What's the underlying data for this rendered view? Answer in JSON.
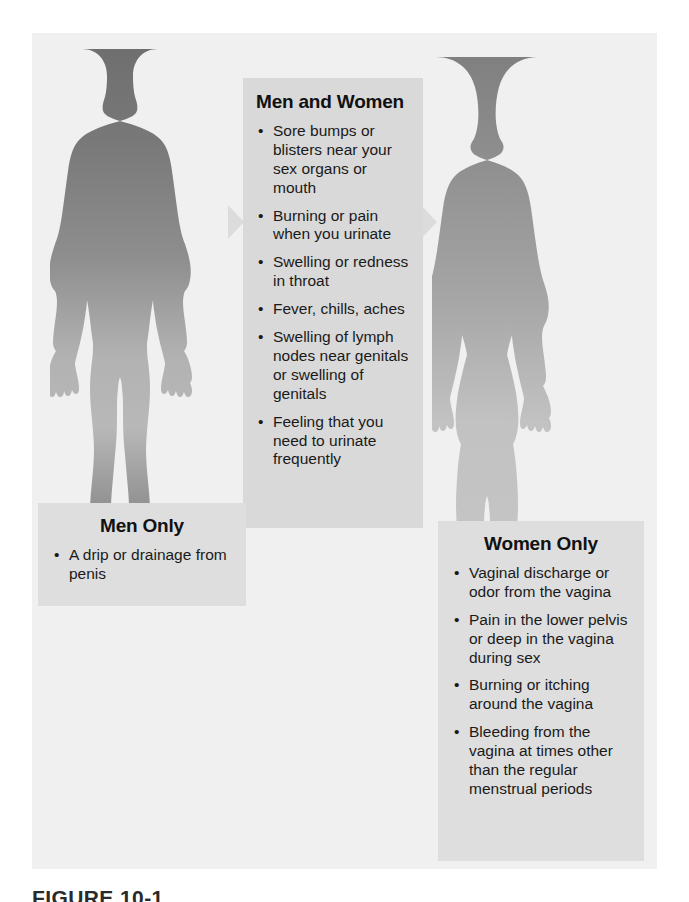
{
  "figure": {
    "caption": "FIGURE 10-1",
    "background_color": "#f0f0f0",
    "panel_color": "#d9d9d9"
  },
  "silhouettes": {
    "male": {
      "name": "male-body-silhouette",
      "gradient_top_color": "#7b7b7b",
      "gradient_mid_color": "#b9b9b9",
      "gradient_bottom_color": "#8a8a8a"
    },
    "female": {
      "name": "female-body-silhouette",
      "gradient_top_color": "#8c8c8c",
      "gradient_mid_color": "#c4c4c4",
      "gradient_bottom_color": "#9a9a9a"
    }
  },
  "arrows": {
    "left": "arrow-pointing-right",
    "right": "arrow-pointing-right",
    "color": "#dcdcdc"
  },
  "panels": {
    "men_and_women": {
      "title": "Men and Women",
      "items": [
        "Sore bumps or blisters near your sex organs or mouth",
        "Burning or pain when you urinate",
        "Swelling or redness in throat",
        "Fever, chills, aches",
        "Swelling of lymph nodes near genitals or swelling of genitals",
        "Feeling that you need to urinate frequently"
      ]
    },
    "men_only": {
      "title": "Men Only",
      "items": [
        "A drip or drainage from penis"
      ]
    },
    "women_only": {
      "title": "Women Only",
      "items": [
        "Vaginal discharge or odor from the vagina",
        "Pain in the lower pelvis or deep in the vagina during sex",
        "Burning or itching around the vagina",
        "Bleeding from the vagina at times other than the regular menstrual periods"
      ]
    }
  },
  "bullet_glyph": "•"
}
